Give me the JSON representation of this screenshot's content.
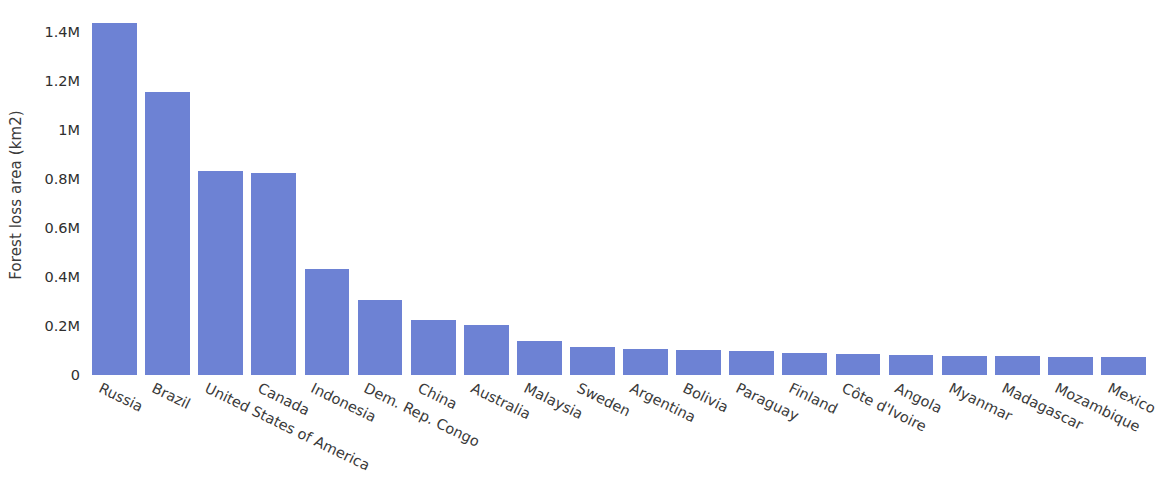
{
  "chart_data": {
    "type": "bar",
    "title": "",
    "xlabel": "",
    "ylabel": "Forest loss area (km2)",
    "categories": [
      "Russia",
      "Brazil",
      "United States of America",
      "Canada",
      "Indonesia",
      "Dem. Rep. Congo",
      "China",
      "Australia",
      "Malaysia",
      "Sweden",
      "Argentina",
      "Bolivia",
      "Paraguay",
      "Finland",
      "Côte d'Ivoire",
      "Angola",
      "Myanmar",
      "Madagascar",
      "Mozambique",
      "Mexico"
    ],
    "values": [
      1440000,
      1155000,
      835000,
      827000,
      435000,
      308000,
      223000,
      203000,
      140000,
      113000,
      108000,
      103000,
      99000,
      92000,
      85000,
      80000,
      78000,
      76000,
      74000,
      72000
    ],
    "ylim": [
      0,
      1500000
    ],
    "yticks": [
      0,
      200000,
      400000,
      600000,
      800000,
      1000000,
      1200000,
      1400000
    ],
    "ytick_labels": [
      "0",
      "0.2M",
      "0.4M",
      "0.6M",
      "0.8M",
      "1M",
      "1.2M",
      "1.4M"
    ],
    "grid": false,
    "legend": null,
    "bar_color": "#6d82d4",
    "text_color": "#3a3a3a",
    "background": "#ffffff"
  }
}
